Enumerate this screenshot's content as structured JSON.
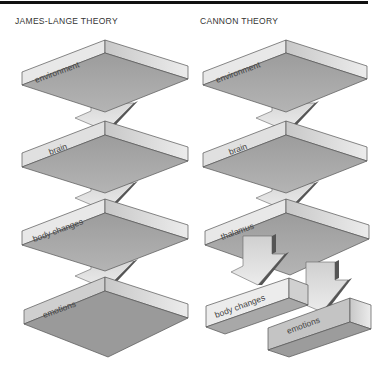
{
  "titles": {
    "left": "JAMES-LANGE THEORY",
    "right": "CANNON THEORY"
  },
  "colors": {
    "rule": "#111111",
    "left_wall": "#e6e6e6",
    "right_wall": "#d4d4d4",
    "underside": "#a8a8a8",
    "arrow_face": "#d9d9d9",
    "arrow_side": "#555555",
    "outline": "#555555"
  },
  "james_lange": {
    "slabs": [
      {
        "label": "environment",
        "vertex_y": 40
      },
      {
        "label": "brain",
        "vertex_y": 121
      },
      {
        "label": "body changes",
        "vertex_y": 199
      },
      {
        "label": "emotions",
        "vertex_y": 277
      }
    ]
  },
  "cannon": {
    "slabs": [
      {
        "label": "environment",
        "vertex_y": 40
      },
      {
        "label": "brain",
        "vertex_y": 121
      },
      {
        "label": "thalamus",
        "vertex_y": 199
      }
    ],
    "outputs": [
      {
        "label": "body changes"
      },
      {
        "label": "emotions"
      }
    ]
  }
}
